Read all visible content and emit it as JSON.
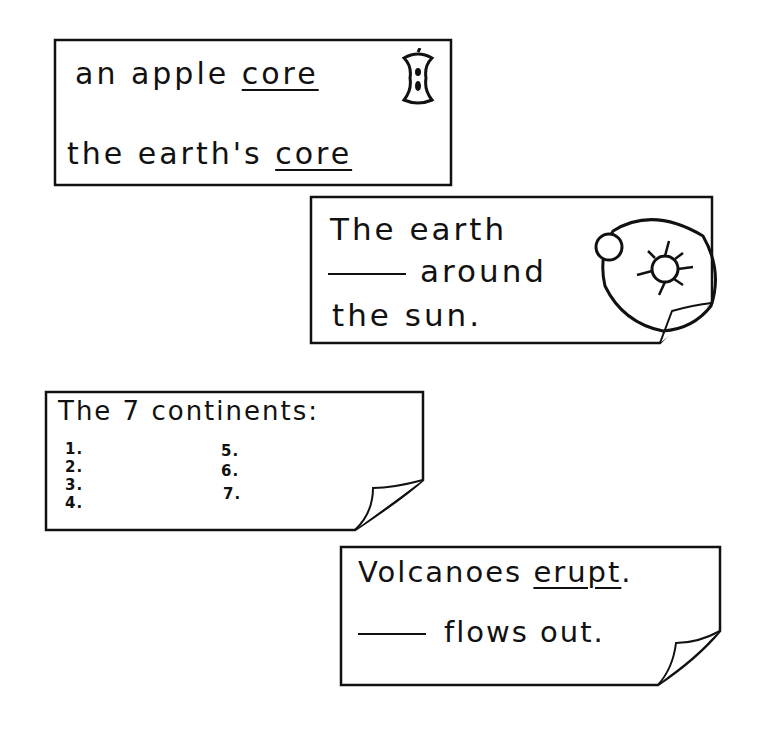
{
  "cards": [
    {
      "id": "apple-core",
      "lines": [
        {
          "before": "an apple ",
          "underlined": "core"
        },
        {
          "before": "the earth's ",
          "underlined": "core"
        }
      ],
      "icon": "apple-core-icon"
    },
    {
      "id": "earth-orbit",
      "lines": [
        "The earth",
        "around",
        "the sun."
      ],
      "blank": "____",
      "icon": "earth-sun-orbit-icon",
      "folded_corner": true
    },
    {
      "id": "continents",
      "title": "The 7 continents:",
      "items": [
        "1.",
        "2.",
        "3.",
        "4.",
        "5.",
        "6.",
        "7."
      ],
      "folded_corner": true
    },
    {
      "id": "volcanoes",
      "lines": [
        {
          "before": "Volcanoes ",
          "underlined": "erupt",
          "after": "."
        },
        {
          "after_blank": "flows out."
        }
      ],
      "blank": "____",
      "folded_corner": true
    }
  ],
  "colors": {
    "ink": "#111111",
    "paper": "#ffffff"
  }
}
